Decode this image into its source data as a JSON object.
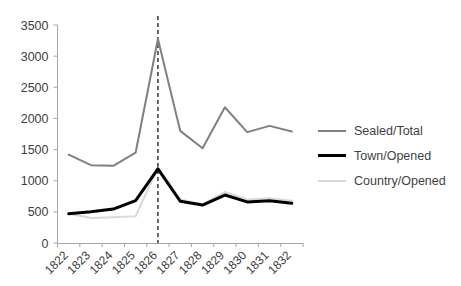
{
  "chart_data": {
    "type": "line",
    "title": "",
    "xlabel": "",
    "ylabel": "",
    "categories": [
      "1822",
      "1823",
      "1824",
      "1825",
      "1826",
      "1827",
      "1828",
      "1829",
      "1830",
      "1831",
      "1832"
    ],
    "ylim": [
      0,
      3500
    ],
    "ytick_step": 500,
    "yticks": [
      "0",
      "500",
      "1000",
      "1500",
      "2000",
      "2500",
      "3000",
      "3500"
    ],
    "grid": false,
    "legend_position": "right",
    "series": [
      {
        "name": "Sealed/Total",
        "color": "#808080",
        "width": 2,
        "values": [
          1420,
          1250,
          1240,
          1450,
          3275,
          1800,
          1520,
          2180,
          1780,
          1880,
          1790
        ]
      },
      {
        "name": "Town/Opened",
        "color": "#000000",
        "width": 3,
        "values": [
          470,
          500,
          545,
          680,
          1190,
          670,
          610,
          770,
          660,
          680,
          640
        ]
      },
      {
        "name": "Country/Opened",
        "color": "#d9d9d9",
        "width": 2,
        "values": [
          470,
          400,
          415,
          430,
          1210,
          700,
          620,
          820,
          700,
          720,
          680
        ]
      }
    ],
    "annotations": [
      {
        "name": "vertical-marker-1826",
        "type": "vline",
        "category": "1826",
        "style": "dashed",
        "color": "#262626"
      }
    ]
  },
  "legend": {
    "items": [
      {
        "label": "Sealed/Total"
      },
      {
        "label": "Town/Opened"
      },
      {
        "label": "Country/Opened"
      }
    ]
  }
}
